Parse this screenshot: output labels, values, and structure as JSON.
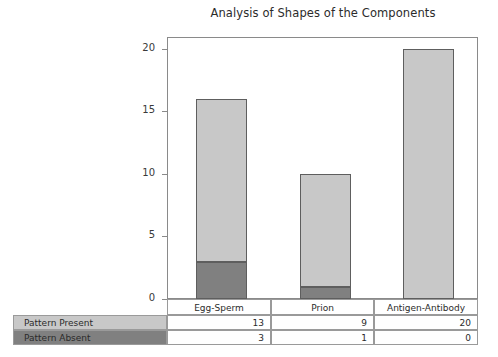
{
  "chart_data": {
    "type": "bar",
    "title": "Analysis of Shapes of the Components",
    "xlabel": "",
    "ylabel": "",
    "ylim": [
      0,
      21
    ],
    "yticks": [
      0,
      5,
      10,
      15,
      20
    ],
    "grid": false,
    "legend_position": "table-below",
    "stacked": true,
    "categories": [
      "Egg-Sperm",
      "Prion",
      "Antigen-Antibody"
    ],
    "series": [
      {
        "name": "Pattern Present",
        "color": "#c8c8c8",
        "values": [
          13,
          9,
          20
        ]
      },
      {
        "name": "Pattern Absent",
        "color": "#808080",
        "values": [
          3,
          1,
          0
        ]
      }
    ],
    "totals": [
      16,
      10,
      20
    ]
  },
  "table": {
    "header": {
      "corner": "",
      "columns": [
        "Egg-Sperm",
        "Prion",
        "Antigen-Antibody"
      ]
    },
    "rows": [
      {
        "label": "Pattern Present",
        "swatch": "#c8c8c8",
        "values": [
          "13",
          "9",
          "20"
        ]
      },
      {
        "label": "Pattern Absent",
        "swatch": "#808080",
        "values": [
          "3",
          "1",
          "0"
        ]
      }
    ]
  },
  "axis": {
    "yticks": [
      "0",
      "5",
      "10",
      "15",
      "20"
    ]
  }
}
